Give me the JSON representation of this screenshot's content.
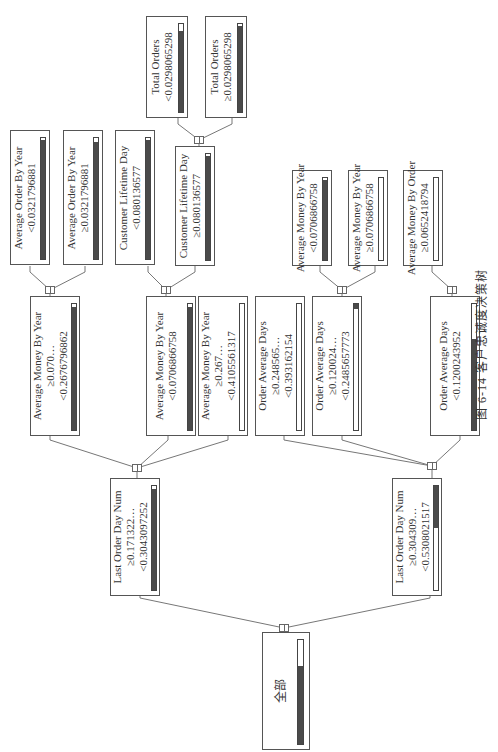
{
  "caption": "图 6-14   客户忠诚度决策树",
  "colors": {
    "border": "#555555",
    "bar_fill": "#4a4a4a",
    "line": "#777777"
  },
  "tree": {
    "root": {
      "label": "全部",
      "fill": 0.75
    },
    "level1": [
      {
        "id": "l1a",
        "lines": [
          "Last Order Day Num",
          "≥0.171322…",
          "<0.3043097252"
        ],
        "fill": 0.97
      },
      {
        "id": "l1b",
        "lines": [
          "Last Order Day Num",
          "≥0.304309…",
          "<0.5308021517"
        ],
        "fill": 0.4
      }
    ],
    "level2": [
      {
        "id": "l2a",
        "lines": [
          "Average Money By Year",
          "≥0.070…",
          "<0.2676796862"
        ],
        "fill": 0.98
      },
      {
        "id": "l2b",
        "lines": [
          "Average Money By Year",
          "<0.0706866758"
        ],
        "fill": 0.98
      },
      {
        "id": "l2c",
        "lines": [
          "Average Money By Year",
          "≥0.267…",
          "<0.4105561317"
        ],
        "fill": 0.0
      },
      {
        "id": "l2d",
        "lines": [
          "Order Average Days",
          "≥0.248565…",
          "<0.393162154"
        ],
        "fill": 0.0
      },
      {
        "id": "l2e",
        "lines": [
          "Order Average Days",
          "≥0.120024…",
          "<0.2485657773"
        ],
        "fill": 0.04
      },
      {
        "id": "l2f",
        "lines": [
          "Order Average Days",
          "<0.1200243952"
        ],
        "fill": 0.72
      }
    ],
    "level3": [
      {
        "id": "l3a",
        "lines": [
          "Average Order By Year",
          "<0.0321796881"
        ],
        "fill": 0.98
      },
      {
        "id": "l3b",
        "lines": [
          "Average Order By Year",
          "≥0.0321796881"
        ],
        "fill": 0.97
      },
      {
        "id": "l3c",
        "lines": [
          "Customer Lifetime Day",
          "<0.080136577"
        ],
        "fill": 0.98
      },
      {
        "id": "l3d",
        "lines": [
          "Customer Lifetime Day",
          "≥0.080136577"
        ],
        "fill": 0.98
      },
      {
        "id": "l3e",
        "lines": [
          "Average Money By Year",
          "<0.0706866758"
        ],
        "fill": 0.98
      },
      {
        "id": "l3f",
        "lines": [
          "Average Money By Year",
          "≥0.0706866758"
        ],
        "fill": 0.0
      },
      {
        "id": "l3g",
        "lines": [
          "Average Money By Order",
          "≥0.0652418794"
        ],
        "fill": 0.0
      }
    ],
    "level4": [
      {
        "id": "l4a",
        "lines": [
          "Total Orders",
          "<0.0298065298"
        ],
        "fill": 0.92
      },
      {
        "id": "l4b",
        "lines": [
          "Total Orders",
          "≥0.0298065298"
        ],
        "fill": 0.98
      }
    ]
  }
}
